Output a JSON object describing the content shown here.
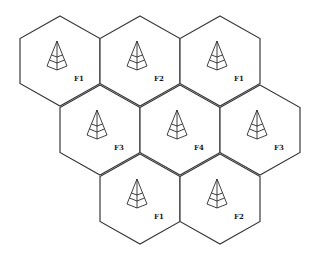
{
  "diagram": {
    "cells": [
      {
        "id": "cell-1",
        "row": 1,
        "cx": 60,
        "cy": 61,
        "label": "F1",
        "icon": "antenna-tower-icon"
      },
      {
        "id": "cell-2",
        "row": 1,
        "cx": 140,
        "cy": 61,
        "label": "F2",
        "icon": "antenna-tower-icon"
      },
      {
        "id": "cell-3",
        "row": 1,
        "cx": 220,
        "cy": 61,
        "label": "F1",
        "icon": "antenna-tower-icon"
      },
      {
        "id": "cell-4",
        "row": 2,
        "cx": 100,
        "cy": 130,
        "label": "F3",
        "icon": "antenna-tower-icon"
      },
      {
        "id": "cell-5",
        "row": 2,
        "cx": 180,
        "cy": 130,
        "label": "F4",
        "icon": "antenna-tower-icon"
      },
      {
        "id": "cell-6",
        "row": 2,
        "cx": 260,
        "cy": 130,
        "label": "F3",
        "icon": "antenna-tower-icon"
      },
      {
        "id": "cell-7",
        "row": 3,
        "cx": 140,
        "cy": 199,
        "label": "F1",
        "icon": "antenna-tower-icon"
      },
      {
        "id": "cell-8",
        "row": 3,
        "cx": 220,
        "cy": 199,
        "label": "F2",
        "icon": "antenna-tower-icon"
      }
    ],
    "colors": {
      "stroke": "#3a3a3a",
      "background": "#ffffff"
    }
  }
}
